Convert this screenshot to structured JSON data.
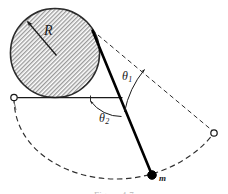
{
  "figure": {
    "title_caption": "Figure 4.7",
    "labels": {
      "radius": "R",
      "angle_1_symbol": "θ",
      "angle_1_subscript": "1",
      "angle_2_symbol": "θ",
      "angle_2_subscript": "2",
      "mass": "m"
    },
    "colors": {
      "ink": "#1a1a1a",
      "rod": "#000000",
      "dashed": "#3a3a3a",
      "hatch": "#8a8a8a",
      "circle_outline": "#2b2b2b",
      "background": "#ffffff",
      "caption": "#b9b9b9"
    },
    "geometry": {
      "disk_center_x": 55,
      "disk_center_y": 53,
      "disk_radius": 45,
      "pivot_left_x": 14,
      "pivot_left_y": 98,
      "pivot_right_x": 214,
      "pivot_right_y": 133,
      "mass_x": 152,
      "mass_y": 175,
      "tangent_point_x": 93,
      "tangent_point_y": 31
    },
    "elements": {
      "disk_name": "hatched-disk",
      "rod_name": "pendulum-rod",
      "mass_name": "point-mass",
      "arc_name": "dashed-trajectory-arc",
      "chord_name": "dashed-chord-line",
      "horizontal_name": "horizontal-reference-line"
    }
  }
}
